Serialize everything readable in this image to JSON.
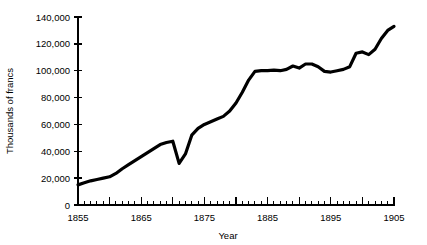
{
  "chart_data": {
    "type": "line",
    "title": "",
    "xlabel": "Year",
    "ylabel": "Thousands of francs",
    "xlim": [
      1855,
      1905
    ],
    "ylim": [
      0,
      140000
    ],
    "grid": false,
    "legend": null,
    "x_tick_labels": [
      "1855",
      "1865",
      "1875",
      "1885",
      "1895",
      "1905"
    ],
    "x_tick_values": [
      1855,
      1865,
      1875,
      1885,
      1895,
      1905
    ],
    "x_major_tick_interval": 5,
    "x_minor_tick_interval": 1,
    "y_tick_labels": [
      "0",
      "20,000",
      "40,000",
      "60,000",
      "80,000",
      "100,000",
      "120,000",
      "140,000"
    ],
    "y_tick_values": [
      0,
      20000,
      40000,
      60000,
      80000,
      100000,
      120000,
      140000
    ],
    "series": [
      {
        "name": "Thousands of francs",
        "x": [
          1855,
          1856,
          1857,
          1858,
          1859,
          1860,
          1861,
          1862,
          1863,
          1864,
          1865,
          1866,
          1867,
          1868,
          1869,
          1870,
          1871,
          1872,
          1873,
          1874,
          1875,
          1876,
          1877,
          1878,
          1879,
          1880,
          1881,
          1882,
          1883,
          1884,
          1885,
          1886,
          1887,
          1888,
          1889,
          1890,
          1891,
          1892,
          1893,
          1894,
          1895,
          1896,
          1897,
          1898,
          1899,
          1900,
          1901,
          1902,
          1903,
          1904,
          1905
        ],
        "values": [
          15000,
          16500,
          18000,
          19000,
          20000,
          21000,
          23500,
          27000,
          30000,
          33000,
          36000,
          39000,
          42000,
          45000,
          46500,
          47500,
          31000,
          38000,
          52000,
          57000,
          60000,
          62000,
          64000,
          66000,
          70000,
          76000,
          84000,
          93000,
          99500,
          100000,
          100000,
          100500,
          100000,
          101000,
          103500,
          102000,
          105000,
          105000,
          103000,
          99500,
          99000,
          100000,
          101000,
          103000,
          113000,
          114000,
          112000,
          116000,
          124000,
          130000,
          133000
        ]
      }
    ]
  }
}
